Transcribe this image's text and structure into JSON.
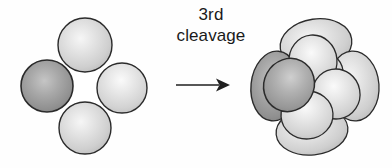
{
  "figure": {
    "title_lines": [
      "3rd",
      "cleavage"
    ],
    "background_color": "#fefefe",
    "outline_color": "#2b2b2b",
    "arrow": {
      "name": "transition-arrow",
      "direction": "right",
      "x_start": 176,
      "x_end": 228,
      "y": 85
    },
    "stages": [
      {
        "name": "four-cell-stage",
        "cell_count": 4,
        "cells": [
          {
            "label": "top-blastomere",
            "cx": 85,
            "cy": 45,
            "r": 27,
            "shade": "light"
          },
          {
            "label": "left-blastomere",
            "cx": 47,
            "cy": 86,
            "r": 26,
            "shade": "dark"
          },
          {
            "label": "right-blastomere",
            "cx": 122,
            "cy": 88,
            "r": 25,
            "shade": "light"
          },
          {
            "label": "bottom-blastomere",
            "cx": 85,
            "cy": 128,
            "r": 26,
            "shade": "light"
          }
        ]
      },
      {
        "name": "eight-cell-stage",
        "cell_count": 8,
        "cells": [
          {
            "label": "back-top-blastomere",
            "shade": "light"
          },
          {
            "label": "back-left-blastomere",
            "shade": "dark"
          },
          {
            "label": "back-right-blastomere",
            "shade": "light"
          },
          {
            "label": "back-bottom-blastomere",
            "shade": "light"
          },
          {
            "label": "front-top-blastomere",
            "shade": "light"
          },
          {
            "label": "front-left-blastomere",
            "shade": "dark"
          },
          {
            "label": "front-right-blastomere",
            "shade": "light"
          },
          {
            "label": "front-bottom-blastomere",
            "shade": "light"
          }
        ]
      }
    ],
    "colors": {
      "cell_light": "#d8d8d8",
      "cell_light_highlight": "#f2f2f2",
      "cell_dark": "#9a9a9a",
      "cell_dark_highlight": "#bdbdbd",
      "outline": "#2b2b2b",
      "gap": "#ffffff"
    }
  }
}
